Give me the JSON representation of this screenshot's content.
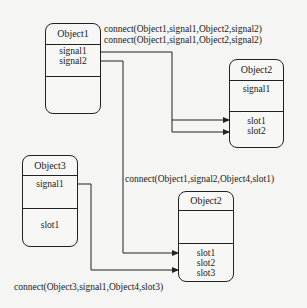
{
  "objects": {
    "object1": {
      "title": "Object1",
      "signals": [
        "signal1",
        "signal2"
      ],
      "slots": []
    },
    "object2_top": {
      "title": "Object2",
      "signals": [
        "signal1"
      ],
      "slots": [
        "slot1",
        "slot2"
      ]
    },
    "object3": {
      "title": "Object3",
      "signals": [
        "signal1"
      ],
      "slots": [
        "slot1"
      ]
    },
    "object2_bottom": {
      "title": "Object2",
      "signals": [],
      "slots": [
        "slot1",
        "slot2",
        "slot3"
      ]
    }
  },
  "connections": [
    {
      "label": "connect(Object1,signal1,Object2,signal2)"
    },
    {
      "label": "connect(Object1,signal1,Object2,signal2)"
    },
    {
      "label": "connect(Object1,signal2,Object4,slot1)"
    },
    {
      "label": "connect(Object3,signal1,Object4,slot3)"
    }
  ],
  "colors": {
    "line": "#222222",
    "background": "#f5f5f3"
  }
}
